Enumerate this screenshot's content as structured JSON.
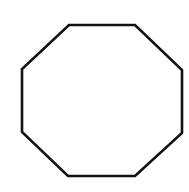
{
  "diagram": {
    "shape": "octagon",
    "background": "#ffffff",
    "stroke": "#111111",
    "stroke_width": 2.6,
    "fill": "none",
    "vertices": [
      [
        69,
        25
      ],
      [
        135,
        25
      ],
      [
        182,
        70
      ],
      [
        182,
        133
      ],
      [
        135,
        176
      ],
      [
        68,
        176
      ],
      [
        22,
        132
      ],
      [
        22,
        69
      ]
    ]
  }
}
